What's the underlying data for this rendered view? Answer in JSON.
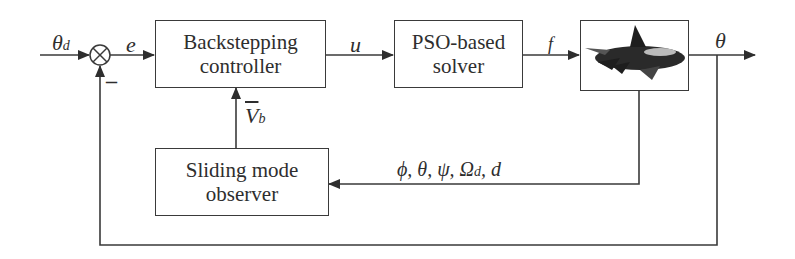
{
  "blocks": {
    "controller": {
      "line1": "Backstepping",
      "line2": "controller"
    },
    "solver": {
      "line1": "PSO-based",
      "line2": "solver"
    },
    "plant": {
      "icon": "aircraft-image"
    },
    "observer": {
      "line1": "Sliding mode",
      "line2": "observer"
    }
  },
  "signals": {
    "input": {
      "symbol": "θ",
      "sub": "d"
    },
    "error": "e",
    "control": "u",
    "force": "f",
    "output": "θ",
    "estimate": {
      "symbol": "V",
      "sub": "b"
    },
    "measured": {
      "text": "ϕ, θ, ψ, Ω",
      "sub": "d",
      "tail": ", d"
    },
    "feedback_sign": "–"
  },
  "colors": {
    "line": "#3a3a3a",
    "background": "#ffffff"
  }
}
